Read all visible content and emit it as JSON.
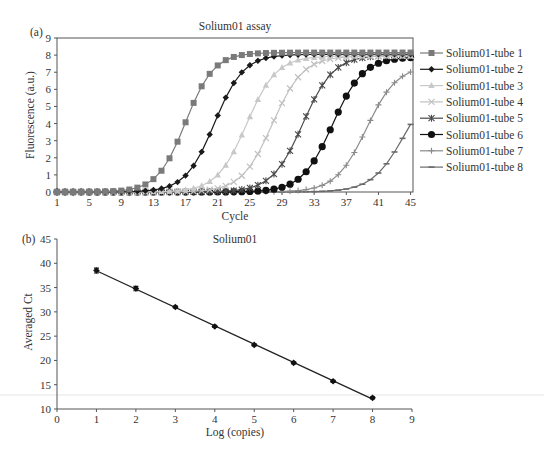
{
  "chart_data": [
    {
      "panel": "(a)",
      "type": "line",
      "title": "Solium01 assay",
      "xlabel": "Cycle",
      "ylabel": "Fluorescence (a.u.)",
      "xlim": [
        1,
        45.3
      ],
      "ylim": [
        0,
        9
      ],
      "xticks": [
        1,
        5,
        9,
        13,
        17,
        21,
        25,
        29,
        33,
        37,
        41,
        45
      ],
      "yticks": [
        0,
        1,
        2,
        3,
        4,
        5,
        6,
        7,
        8,
        9
      ],
      "grid": false,
      "legend_position": "right",
      "x": [
        1,
        2,
        3,
        4,
        5,
        6,
        7,
        8,
        9,
        10,
        11,
        12,
        13,
        14,
        15,
        16,
        17,
        18,
        19,
        20,
        21,
        22,
        23,
        24,
        25,
        26,
        27,
        28,
        29,
        30,
        31,
        32,
        33,
        34,
        35,
        36,
        37,
        38,
        39,
        40,
        41,
        42,
        43,
        44,
        45
      ],
      "series": [
        {
          "name": "Solium01-tube 1",
          "color": "#7a7a7a",
          "marker": "square",
          "plateau": 8.15,
          "midpoint": 17.0,
          "slope": 1.75
        },
        {
          "name": "Solium01-tube 2",
          "color": "#1a1a1a",
          "marker": "diamond",
          "plateau": 8.05,
          "midpoint": 20.6,
          "slope": 1.8
        },
        {
          "name": "Solium01-tube 3",
          "color": "#c8c8c8",
          "marker": "triangle",
          "plateau": 7.95,
          "midpoint": 24.6,
          "slope": 1.85
        },
        {
          "name": "Solium01-tube 4",
          "color": "#c0c0c0",
          "marker": "x",
          "plateau": 7.95,
          "midpoint": 27.8,
          "slope": 1.9
        },
        {
          "name": "Solium01-tube 5",
          "color": "#4a4a4a",
          "marker": "star",
          "plateau": 8.0,
          "midpoint": 31.6,
          "slope": 1.9
        },
        {
          "name": "Solium01-tube 6",
          "color": "#111111",
          "marker": "circle",
          "plateau": 7.9,
          "midpoint": 35.3,
          "slope": 1.9
        },
        {
          "name": "Solium01-tube 7",
          "color": "#8a8a8a",
          "marker": "plus",
          "plateau": 7.4,
          "midpoint": 39.5,
          "slope": 1.9
        },
        {
          "name": "Solium01-tube 8",
          "color": "#6a6a6a",
          "marker": "dash",
          "plateau": 6.6,
          "midpoint": 44.2,
          "slope": 2.0
        }
      ]
    },
    {
      "panel": "(b)",
      "type": "scatter",
      "title": "Solium01",
      "xlabel": "Log (copies)",
      "ylabel": "Averaged Ct",
      "xlim": [
        0,
        9
      ],
      "ylim": [
        10,
        45
      ],
      "xticks": [
        0,
        1,
        2,
        3,
        4,
        5,
        6,
        7,
        8,
        9
      ],
      "yticks": [
        10,
        15,
        20,
        25,
        30,
        35,
        40,
        45
      ],
      "grid": false,
      "x": [
        1,
        2,
        3,
        4,
        5,
        6,
        7,
        8
      ],
      "y": [
        38.5,
        34.8,
        31.0,
        27.0,
        23.2,
        19.5,
        15.7,
        12.3
      ],
      "error": [
        0.5,
        0.45,
        0.2,
        0.2,
        0.2,
        0.2,
        0.2,
        0.2
      ],
      "trendline": {
        "type": "linear",
        "from_x": 1,
        "to_x": 8
      }
    }
  ]
}
